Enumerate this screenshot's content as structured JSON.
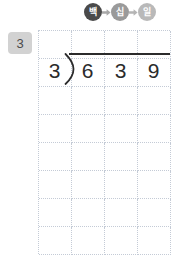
{
  "worksheet": {
    "name": "long-division-worksheet",
    "step_label": "3",
    "place_values": [
      {
        "label": "백",
        "meaning": "hundreds",
        "tone": "tone-dark",
        "color": "#4a4a4a"
      },
      {
        "label": "십",
        "meaning": "tens",
        "tone": "tone-mid",
        "color": "#9a9a9a"
      },
      {
        "label": "일",
        "meaning": "ones",
        "tone": "tone-light",
        "color": "#b9b9b9"
      }
    ],
    "arrow_glyph": "arrow-right-icon",
    "division": {
      "divisor": "3",
      "dividend_digits": [
        "6",
        "3",
        "9"
      ],
      "dividend": "639",
      "quotient": "",
      "operator": "long-division-bracket"
    },
    "grid": {
      "columns": 4,
      "rows": 8,
      "cell_width": 33,
      "cell_height": 28,
      "line_style": "dotted",
      "line_color": "#c4cbd6"
    }
  }
}
